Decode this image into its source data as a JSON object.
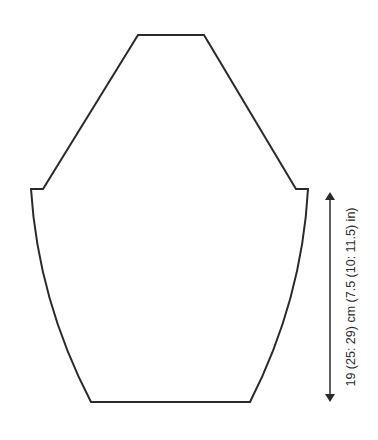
{
  "diagram": {
    "type": "knitting-schematic",
    "piece": "sleeve",
    "colors": {
      "outline": "#2a2a2a",
      "background": "#ffffff"
    },
    "measurements": [
      {
        "name": "sleeve-length",
        "label": "19 (25: 29) cm (7.5 (10: 11.5) in)",
        "orientation": "vertical"
      }
    ]
  }
}
